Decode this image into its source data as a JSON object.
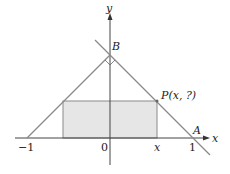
{
  "diagram": {
    "axes": {
      "x_label": "x",
      "y_label": "y"
    },
    "ticks": {
      "neg_one": "−1",
      "zero": "0",
      "x": "x",
      "one": "1"
    },
    "points": {
      "A": "A",
      "B": "B",
      "P": "P(x, ?)"
    },
    "colors": {
      "line": "#8a8a8a",
      "rect_fill": "#e6e6e6",
      "axis": "#333333"
    }
  }
}
